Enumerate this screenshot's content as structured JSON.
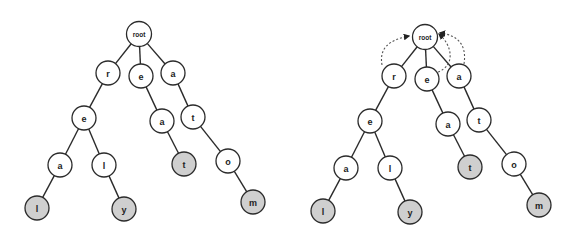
{
  "diagram": {
    "type": "trie",
    "words": [
      "real",
      "rely",
      "eat",
      "atom"
    ],
    "colors": {
      "terminal_fill": "#cfcfcf",
      "internal_fill": "#ffffff",
      "stroke": "#2b2b2b",
      "link": "#555555"
    },
    "trees": [
      {
        "id": "trie-plain",
        "offset_x": 0,
        "offset_y": 0,
        "show_failure_links": false
      },
      {
        "id": "trie-with-links",
        "offset_x": 286,
        "offset_y": 3,
        "show_failure_links": true
      }
    ],
    "nodes": [
      {
        "id": "root",
        "label": "root",
        "x": 139,
        "y": 34,
        "r": 12.5,
        "terminal": false
      },
      {
        "id": "r",
        "label": "r",
        "x": 108,
        "y": 73,
        "r": 12,
        "terminal": false
      },
      {
        "id": "e1",
        "label": "e",
        "x": 141,
        "y": 76,
        "r": 12,
        "terminal": false
      },
      {
        "id": "a1",
        "label": "a",
        "x": 173,
        "y": 73,
        "r": 12,
        "terminal": false
      },
      {
        "id": "re",
        "label": "e",
        "x": 84,
        "y": 118,
        "r": 12,
        "terminal": false
      },
      {
        "id": "ea",
        "label": "a",
        "x": 162,
        "y": 121,
        "r": 12,
        "terminal": false
      },
      {
        "id": "at",
        "label": "t",
        "x": 193,
        "y": 117,
        "r": 12,
        "terminal": false
      },
      {
        "id": "rea",
        "label": "a",
        "x": 60,
        "y": 165,
        "r": 12,
        "terminal": false
      },
      {
        "id": "rel",
        "label": "l",
        "x": 104,
        "y": 165,
        "r": 12,
        "terminal": false
      },
      {
        "id": "eat",
        "label": "t",
        "x": 184,
        "y": 164,
        "r": 12,
        "terminal": true
      },
      {
        "id": "ato",
        "label": "o",
        "x": 228,
        "y": 161,
        "r": 12,
        "terminal": false
      },
      {
        "id": "real",
        "label": "l",
        "x": 37,
        "y": 208,
        "r": 12,
        "terminal": true
      },
      {
        "id": "rely",
        "label": "y",
        "x": 124,
        "y": 209,
        "r": 12,
        "terminal": true
      },
      {
        "id": "atom",
        "label": "m",
        "x": 253,
        "y": 202,
        "r": 12,
        "terminal": true
      }
    ],
    "edges": [
      [
        "root",
        "r"
      ],
      [
        "root",
        "e1"
      ],
      [
        "root",
        "a1"
      ],
      [
        "r",
        "re"
      ],
      [
        "e1",
        "ea"
      ],
      [
        "a1",
        "at"
      ],
      [
        "re",
        "rea"
      ],
      [
        "re",
        "rel"
      ],
      [
        "ea",
        "eat"
      ],
      [
        "at",
        "ato"
      ],
      [
        "rea",
        "real"
      ],
      [
        "rel",
        "rely"
      ],
      [
        "ato",
        "atom"
      ]
    ],
    "failure_links": [
      {
        "from": "r",
        "to": "root",
        "path": "M 96 62 C 93 45, 103 37, 123 33"
      },
      {
        "from": "e1",
        "to": "root",
        "path": "M 152 69 C 170 62, 166 42, 153 31"
      },
      {
        "from": "a1",
        "to": "root",
        "path": "M 178 61 C 181 42, 172 32, 154 30"
      }
    ]
  }
}
